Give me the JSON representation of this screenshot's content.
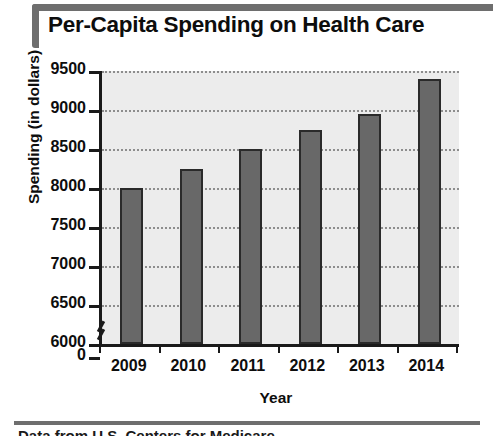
{
  "chart_data": {
    "type": "bar",
    "title": "Per-Capita Spending on Health Care",
    "subtitle": "",
    "xlabel": "Year",
    "ylabel": "Spending (in dollars)",
    "categories": [
      "2009",
      "2010",
      "2011",
      "2012",
      "2013",
      "2014"
    ],
    "values": [
      8000,
      8250,
      8500,
      8750,
      8950,
      9400
    ],
    "series": [
      {
        "name": "Per-capita spending",
        "values": [
          8000,
          8250,
          8500,
          8750,
          8950,
          9400
        ]
      }
    ],
    "ylim": [
      6000,
      9500
    ],
    "yticks": [
      0,
      6000,
      6500,
      7000,
      7500,
      8000,
      8500,
      9000,
      9500
    ],
    "ytick_labels": [
      "0",
      "6000",
      "6500",
      "7000",
      "7500",
      "8000",
      "8500",
      "9000",
      "9500"
    ],
    "y_axis_break": true,
    "y_axis_break_between": [
      0,
      6000
    ],
    "grid": true,
    "grid_style": "dotted-horizontal",
    "legend": "none",
    "bar_color": "#686868",
    "bar_edge_color": "#2a2a2a",
    "plot_background": "#ececec",
    "axis_color": "#1a1a1a",
    "title_accent_color": "#6e6e6e"
  },
  "footer": {
    "source_note": "Data from U.S. Centers for Medicare"
  }
}
